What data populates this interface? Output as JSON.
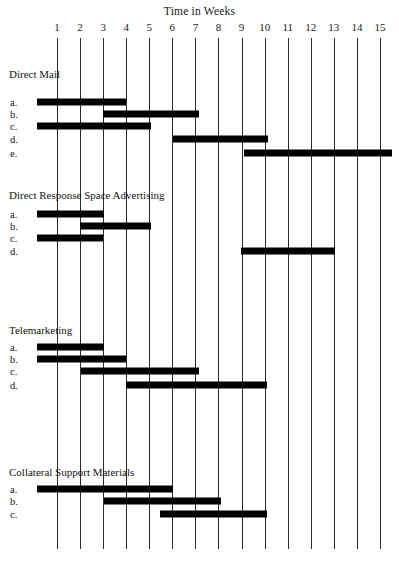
{
  "chart_data": {
    "type": "bar",
    "subtype": "gantt",
    "title": "Time in Weeks",
    "xlabel": "Time in Weeks",
    "ylabel": "",
    "xlim": [
      0.3,
      15.6
    ],
    "grid": true,
    "legend": "none",
    "x_ticks": [
      1,
      2,
      3,
      4,
      5,
      6,
      7,
      8,
      9,
      10,
      11,
      12,
      13,
      14,
      15
    ],
    "x_tick_labels": [
      "1",
      "2",
      "3",
      "4",
      "5",
      "6",
      "7",
      "8",
      "9",
      "10",
      "11",
      "12",
      "13",
      "14",
      "15"
    ],
    "bar_color": "#000000",
    "gridline_color": "#2b2b2b",
    "groups": [
      {
        "name": "Direct Mail",
        "tasks": [
          {
            "label": "a.",
            "start": 0.13,
            "end": 4.0
          },
          {
            "label": "b.",
            "start": 3.0,
            "end": 7.14
          },
          {
            "label": "c.",
            "start": 0.13,
            "end": 5.09
          },
          {
            "label": "d.",
            "start": 6.04,
            "end": 10.13
          },
          {
            "label": "e.",
            "start": 9.09,
            "end": 15.52
          }
        ]
      },
      {
        "name": "Direct Response Space Advertising",
        "tasks": [
          {
            "label": "a.",
            "start": 0.13,
            "end": 3.04
          },
          {
            "label": "b.",
            "start": 2.0,
            "end": 5.09
          },
          {
            "label": "c.",
            "start": 0.13,
            "end": 3.0
          },
          {
            "label": "d.",
            "start": 8.96,
            "end": 13.04
          }
        ]
      },
      {
        "name": "Telemarketing",
        "tasks": [
          {
            "label": "a.",
            "start": 0.13,
            "end": 3.04
          },
          {
            "label": "b.",
            "start": 0.13,
            "end": 4.0
          },
          {
            "label": "c.",
            "start": 2.04,
            "end": 7.14
          },
          {
            "label": "d.",
            "start": 4.0,
            "end": 10.09
          }
        ]
      },
      {
        "name": "Collateral Support Materials",
        "tasks": [
          {
            "label": "a.",
            "start": 0.13,
            "end": 6.04
          },
          {
            "label": "b.",
            "start": 3.04,
            "end": 8.09
          },
          {
            "label": "c.",
            "start": 5.48,
            "end": 10.09
          }
        ]
      }
    ]
  },
  "layout": {
    "x_week1_px": 57,
    "x_week_step_px": 23.07,
    "grid_top_px": 38,
    "grid_bottom_px": 549,
    "groups_geometry": [
      {
        "title_y_px": 68,
        "row_y_px": [
          102,
          114,
          126,
          139,
          153
        ]
      },
      {
        "title_y_px": 189,
        "row_y_px": [
          214,
          226,
          238,
          251
        ]
      },
      {
        "title_y_px": 324,
        "row_y_px": [
          347,
          359,
          371,
          385
        ]
      },
      {
        "title_y_px": 466,
        "row_y_px": [
          489,
          501,
          514
        ]
      }
    ]
  }
}
